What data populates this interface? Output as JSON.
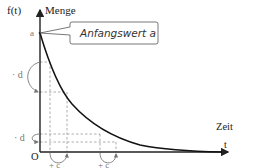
{
  "diagram": {
    "type": "exponential-decay",
    "y_axis": {
      "label_function": "f(t)",
      "label_quantity": "Menge"
    },
    "x_axis": {
      "label_quantity": "Zeit",
      "label_variable": "t"
    },
    "origin_label": "O",
    "start_value_label": "a",
    "callout": {
      "text": "Anfangswert a"
    },
    "decrement_labels": [
      "· d",
      "· d"
    ],
    "increment_labels": [
      "+ c",
      "+ c"
    ],
    "colors": {
      "axis": "#222222",
      "curve": "#111111",
      "dashed": "#888888",
      "callout_border": "#555555"
    }
  }
}
